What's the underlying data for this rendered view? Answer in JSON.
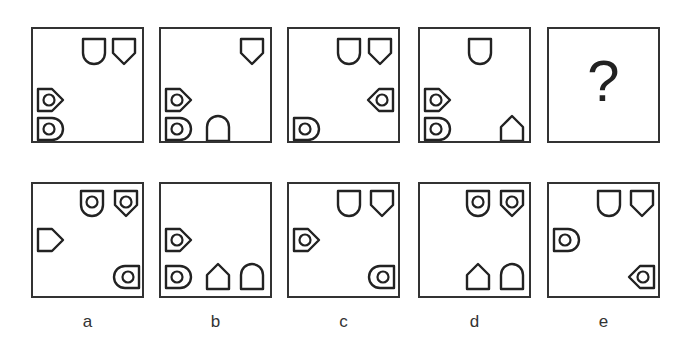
{
  "question_mark": "?",
  "top_row": [
    {
      "id": "p1",
      "left": 31,
      "top": 27,
      "shapes": [
        {
          "type": "round-bottom",
          "x": 48,
          "y": 8,
          "rot": 0,
          "circle": false
        },
        {
          "type": "point-bottom",
          "x": 78,
          "y": 8,
          "rot": 0,
          "circle": false
        },
        {
          "type": "point-bottom",
          "x": 4,
          "y": 57,
          "rot": -90,
          "circle": true
        },
        {
          "type": "round-bottom",
          "x": 4,
          "y": 86,
          "rot": -90,
          "circle": true
        }
      ]
    },
    {
      "id": "p2",
      "left": 159,
      "top": 27,
      "shapes": [
        {
          "type": "point-bottom",
          "x": 78,
          "y": 8,
          "rot": 0,
          "circle": false
        },
        {
          "type": "point-bottom",
          "x": 4,
          "y": 57,
          "rot": -90,
          "circle": true
        },
        {
          "type": "round-bottom",
          "x": 4,
          "y": 86,
          "rot": -90,
          "circle": true
        },
        {
          "type": "round-bottom",
          "x": 44,
          "y": 86,
          "rot": 180,
          "circle": false
        }
      ]
    },
    {
      "id": "p3",
      "left": 287,
      "top": 27,
      "shapes": [
        {
          "type": "round-bottom",
          "x": 47,
          "y": 8,
          "rot": 0,
          "circle": false
        },
        {
          "type": "point-bottom",
          "x": 78,
          "y": 8,
          "rot": 0,
          "circle": false
        },
        {
          "type": "point-bottom",
          "x": 79,
          "y": 57,
          "rot": 90,
          "circle": true
        },
        {
          "type": "round-bottom",
          "x": 4,
          "y": 86,
          "rot": -90,
          "circle": true
        }
      ]
    },
    {
      "id": "p4",
      "left": 418,
      "top": 27,
      "shapes": [
        {
          "type": "round-bottom",
          "x": 47,
          "y": 8,
          "rot": 0,
          "circle": false
        },
        {
          "type": "point-bottom",
          "x": 4,
          "y": 57,
          "rot": -90,
          "circle": true
        },
        {
          "type": "round-bottom",
          "x": 4,
          "y": 86,
          "rot": -90,
          "circle": true
        },
        {
          "type": "point-bottom",
          "x": 79,
          "y": 86,
          "rot": 180,
          "circle": false
        }
      ]
    }
  ],
  "options": [
    {
      "label": "a",
      "left": 31,
      "top": 182,
      "shapes": [
        {
          "type": "round-bottom",
          "x": 46,
          "y": 5,
          "rot": 0,
          "circle": true
        },
        {
          "type": "point-bottom",
          "x": 80,
          "y": 5,
          "rot": 0,
          "circle": true
        },
        {
          "type": "point-bottom",
          "x": 4,
          "y": 42,
          "rot": -90,
          "circle": false
        },
        {
          "type": "round-bottom",
          "x": 81,
          "y": 79,
          "rot": 90,
          "circle": true
        }
      ]
    },
    {
      "label": "b",
      "left": 159,
      "top": 182,
      "shapes": [
        {
          "type": "point-bottom",
          "x": 4,
          "y": 42,
          "rot": -90,
          "circle": true
        },
        {
          "type": "round-bottom",
          "x": 4,
          "y": 79,
          "rot": -90,
          "circle": true
        },
        {
          "type": "point-bottom",
          "x": 44,
          "y": 79,
          "rot": 180,
          "circle": false
        },
        {
          "type": "round-bottom",
          "x": 78,
          "y": 79,
          "rot": 180,
          "circle": false
        }
      ]
    },
    {
      "label": "c",
      "left": 287,
      "top": 182,
      "shapes": [
        {
          "type": "round-bottom",
          "x": 47,
          "y": 5,
          "rot": 0,
          "circle": false
        },
        {
          "type": "point-bottom",
          "x": 80,
          "y": 5,
          "rot": 0,
          "circle": false
        },
        {
          "type": "point-bottom",
          "x": 4,
          "y": 42,
          "rot": -90,
          "circle": true
        },
        {
          "type": "round-bottom",
          "x": 80,
          "y": 79,
          "rot": 90,
          "circle": true
        }
      ]
    },
    {
      "label": "d",
      "left": 418,
      "top": 182,
      "shapes": [
        {
          "type": "round-bottom",
          "x": 45,
          "y": 5,
          "rot": 0,
          "circle": true
        },
        {
          "type": "point-bottom",
          "x": 79,
          "y": 5,
          "rot": 0,
          "circle": true
        },
        {
          "type": "point-bottom",
          "x": 45,
          "y": 79,
          "rot": 180,
          "circle": false
        },
        {
          "type": "round-bottom",
          "x": 79,
          "y": 79,
          "rot": 180,
          "circle": false
        }
      ]
    },
    {
      "label": "e",
      "left": 547,
      "top": 182,
      "shapes": [
        {
          "type": "round-bottom",
          "x": 47,
          "y": 5,
          "rot": 0,
          "circle": false
        },
        {
          "type": "point-bottom",
          "x": 80,
          "y": 5,
          "rot": 0,
          "circle": false
        },
        {
          "type": "round-bottom",
          "x": 4,
          "y": 42,
          "rot": -90,
          "circle": true
        },
        {
          "type": "point-bottom",
          "x": 80,
          "y": 79,
          "rot": 90,
          "circle": true
        }
      ]
    }
  ],
  "question_panel": {
    "left": 547,
    "top": 27
  },
  "colors": {
    "stroke": "#222222",
    "border": "#333333"
  }
}
